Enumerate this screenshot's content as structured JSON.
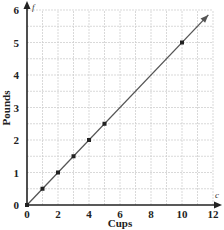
{
  "chart_data": {
    "type": "line",
    "title": "",
    "xlabel": "Cups",
    "ylabel": "Pounds",
    "x_var": "c",
    "y_var": "f",
    "xlim": [
      0,
      12
    ],
    "ylim": [
      0,
      6
    ],
    "x_ticks": [
      "0",
      "2",
      "4",
      "6",
      "8",
      "10",
      "12"
    ],
    "y_ticks": [
      "0",
      "1",
      "2",
      "3",
      "4",
      "5",
      "6"
    ],
    "grid": true,
    "grid_x_step": 1,
    "grid_y_step": 0.5,
    "legend": null,
    "series": [
      {
        "name": "Pounds vs Cups",
        "line": {
          "from": [
            0,
            0
          ],
          "to": [
            11.7,
            5.85
          ],
          "arrow": true
        },
        "points": [
          {
            "x": 0,
            "y": 0
          },
          {
            "x": 1,
            "y": 0.5
          },
          {
            "x": 2,
            "y": 1
          },
          {
            "x": 3,
            "y": 1.5
          },
          {
            "x": 4,
            "y": 2
          },
          {
            "x": 5,
            "y": 2.5
          },
          {
            "x": 10,
            "y": 5
          }
        ]
      }
    ]
  },
  "colors": {
    "axis": "#222222",
    "grid": "#cfcfcf",
    "line": "#555555",
    "point": "#222222"
  }
}
